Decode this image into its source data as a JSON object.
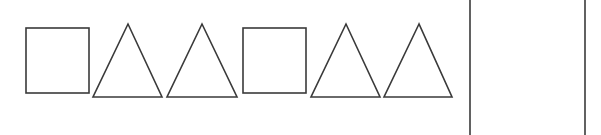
{
  "figure": {
    "stroke_color": "#3a3a3a",
    "background": "#ffffff",
    "sequence": [
      {
        "shape": "square",
        "x": 26,
        "y": 28,
        "w": 63,
        "h": 65
      },
      {
        "shape": "triangle",
        "apex": [
          128,
          24
        ],
        "left": [
          93,
          97
        ],
        "right": [
          162,
          97
        ]
      },
      {
        "shape": "triangle",
        "apex": [
          202,
          24
        ],
        "left": [
          167,
          97
        ],
        "right": [
          237,
          97
        ]
      },
      {
        "shape": "square",
        "x": 243,
        "y": 28,
        "w": 63,
        "h": 65
      },
      {
        "shape": "triangle",
        "apex": [
          346,
          24
        ],
        "left": [
          311,
          97
        ],
        "right": [
          380,
          97
        ]
      },
      {
        "shape": "triangle",
        "apex": [
          419,
          24
        ],
        "left": [
          384,
          97
        ],
        "right": [
          452,
          97
        ]
      }
    ],
    "answer_box": {
      "left_x": 470,
      "right_x": 585
    }
  }
}
